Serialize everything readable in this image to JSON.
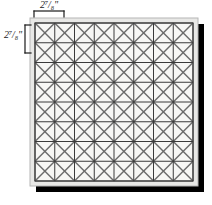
{
  "figure": {
    "kind": "dimensioned-tile-panel-diagram"
  },
  "dimensions": {
    "top": {
      "text": "2⁷/₈\"",
      "whole": "2",
      "fraction": "7/8",
      "unit": "\"",
      "value": 2.875,
      "axis": "horizontal",
      "describes": "cell-width"
    },
    "left": {
      "text": "2⁷/₈\"",
      "whole": "2",
      "fraction": "7/8",
      "unit": "\"",
      "value": 2.875,
      "axis": "vertical",
      "describes": "cell-height"
    }
  },
  "panel": {
    "grid": {
      "columns": 8,
      "rows": 8,
      "cell_has_diagonals": true,
      "diagonal_style": "both-diagonals-x"
    },
    "frame": {
      "outer_left": 30,
      "outer_top": 18,
      "outer_width": 168,
      "outer_height": 168,
      "inner_inset": 5
    },
    "shadow": {
      "offset_x": 6,
      "offset_y": 6,
      "color": "#000000"
    }
  },
  "colors": {
    "fill": "#f7f7f5",
    "grid_line": "#3a3a3a",
    "diagonal_line": "#6b6b6b",
    "frame_outer": "#b6b6b6",
    "frame_inner": "#5a5a5a",
    "shadow": "#000000",
    "label_text": "#1a1a1a",
    "bracket": "#1a1a1a",
    "background": "#ffffff"
  }
}
